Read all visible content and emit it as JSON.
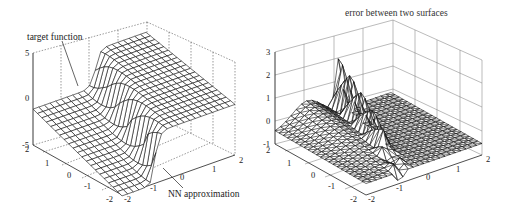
{
  "chart_data": [
    {
      "type": "surface",
      "title": "",
      "annotations": [
        "target function",
        "NN approximation"
      ],
      "x_ticks": [
        "-2",
        "-1",
        "0",
        "1",
        "2"
      ],
      "y_ticks": [
        "-2",
        "-1",
        "0",
        "1",
        "2"
      ],
      "z_ticks": [
        "-5",
        "0",
        "5"
      ],
      "xlim": [
        -2,
        2
      ],
      "ylim": [
        -2,
        2
      ],
      "zlim": [
        -5,
        5
      ],
      "grid": true,
      "description": "Step-like surface: low plateau near 0 to -5 on one side, sharp rise to ~5 plateau on the other; target function and NN approximation overlapped"
    },
    {
      "type": "surface",
      "title": "error between two surfaces",
      "x_ticks": [
        "-2",
        "-1",
        "0",
        "1",
        "2"
      ],
      "y_ticks": [
        "-2",
        "-1",
        "0",
        "1",
        "2"
      ],
      "z_ticks": [
        "-1",
        "0",
        "1",
        "2",
        "3"
      ],
      "xlim": [
        -2,
        2
      ],
      "ylim": [
        -2,
        2
      ],
      "zlim": [
        -1,
        3
      ],
      "grid": true,
      "description": "Error surface mostly between -0.5 and 1, with a sharp ridge up to ~2.5 along the step line"
    }
  ],
  "left": {
    "z_ticks": [
      "5",
      "0",
      "-5"
    ],
    "y_ticks": [
      "2",
      "1",
      "0",
      "-1",
      "-2"
    ],
    "x_ticks": [
      "-2",
      "-1",
      "0",
      "1",
      "2"
    ],
    "annotation_target": "target function",
    "annotation_nn": "NN approximation"
  },
  "right": {
    "title": "error between two surfaces",
    "z_ticks": [
      "3",
      "2",
      "1",
      "0",
      "-1"
    ],
    "y_ticks": [
      "2",
      "1",
      "0",
      "-1",
      "-2"
    ],
    "x_ticks": [
      "-2",
      "-1",
      "0",
      "1",
      "2"
    ]
  }
}
